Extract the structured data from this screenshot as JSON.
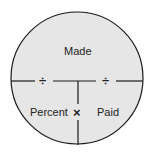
{
  "diagram": {
    "top_label": "Made",
    "bottom_left_label": "Percent",
    "bottom_right_label": "Paid",
    "left_operator": "÷",
    "right_operator": "÷",
    "center_operator": "×",
    "colors": {
      "fill": "#e6e6e6",
      "stroke": "#1a1a1a"
    }
  }
}
